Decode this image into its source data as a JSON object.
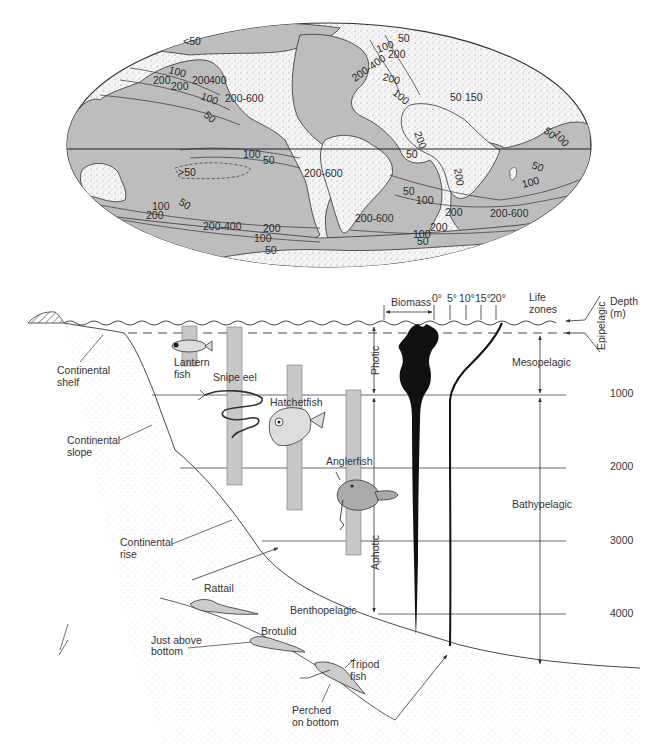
{
  "map": {
    "contour_labels": [
      {
        "text": "<50",
        "x": 183,
        "y": 45
      },
      {
        "text": "100",
        "x": 168,
        "y": 73,
        "rot": 15
      },
      {
        "text": "200",
        "x": 153,
        "y": 84
      },
      {
        "text": "200",
        "x": 171,
        "y": 90
      },
      {
        "text": "200",
        "x": 192,
        "y": 84
      },
      {
        "text": "400",
        "x": 209,
        "y": 84
      },
      {
        "text": "100",
        "x": 200,
        "y": 99,
        "rot": 20
      },
      {
        "text": "200-600",
        "x": 225,
        "y": 102
      },
      {
        "text": "50",
        "x": 203,
        "y": 116,
        "rot": 40
      },
      {
        "text": "50",
        "x": 398,
        "y": 42
      },
      {
        "text": "100",
        "x": 378,
        "y": 53,
        "rot": -20
      },
      {
        "text": "200",
        "x": 388,
        "y": 58
      },
      {
        "text": "200-400",
        "x": 355,
        "y": 82,
        "rot": -35
      },
      {
        "text": "200",
        "x": 382,
        "y": 80,
        "rot": 15
      },
      {
        "text": "100",
        "x": 392,
        "y": 94,
        "rot": 40
      },
      {
        "text": "50",
        "x": 450,
        "y": 101
      },
      {
        "text": "150",
        "x": 465,
        "y": 101
      },
      {
        "text": "200",
        "x": 414,
        "y": 133,
        "rot": 70
      },
      {
        "text": "50",
        "x": 543,
        "y": 132,
        "rot": 40
      },
      {
        "text": "100",
        "x": 553,
        "y": 134,
        "rot": 50
      },
      {
        "text": "50",
        "x": 406,
        "y": 158
      },
      {
        "text": "200",
        "x": 454,
        "y": 169,
        "rot": 80
      },
      {
        "text": ">50",
        "x": 178,
        "y": 176
      },
      {
        "text": "100",
        "x": 243,
        "y": 158
      },
      {
        "text": "50",
        "x": 263,
        "y": 164
      },
      {
        "text": "200-600",
        "x": 304,
        "y": 177
      },
      {
        "text": "50",
        "x": 178,
        "y": 204,
        "rot": 30
      },
      {
        "text": "100",
        "x": 152,
        "y": 210
      },
      {
        "text": "200",
        "x": 146,
        "y": 219
      },
      {
        "text": "50",
        "x": 403,
        "y": 195
      },
      {
        "text": "100",
        "x": 416,
        "y": 204
      },
      {
        "text": "50",
        "x": 531,
        "y": 168,
        "rot": 20
      },
      {
        "text": "100",
        "x": 523,
        "y": 188,
        "rot": -15
      },
      {
        "text": "200-600",
        "x": 355,
        "y": 222
      },
      {
        "text": "200",
        "x": 445,
        "y": 216
      },
      {
        "text": "200-600",
        "x": 490,
        "y": 217
      },
      {
        "text": "200-400",
        "x": 203,
        "y": 230
      },
      {
        "text": "200",
        "x": 263,
        "y": 232
      },
      {
        "text": "100",
        "x": 254,
        "y": 242
      },
      {
        "text": "50",
        "x": 265,
        "y": 254
      },
      {
        "text": "200",
        "x": 430,
        "y": 231
      },
      {
        "text": "100",
        "x": 413,
        "y": 238
      },
      {
        "text": "50",
        "x": 417,
        "y": 245
      }
    ]
  },
  "profile": {
    "header": {
      "biomass": "Biomass",
      "temperatures": [
        "0°",
        "5°",
        "10°",
        "15°",
        "20°"
      ],
      "life_zones_line1": "Life",
      "life_zones_line2": "zones",
      "depth_line1": "Depth",
      "depth_line2": "(m)"
    },
    "depth_ticks": [
      "1000",
      "2000",
      "3000",
      "4000"
    ],
    "light_zones": {
      "photic": "Photic",
      "aphotic": "Aphotic"
    },
    "life_zones": {
      "epipelagic": "Epipelagic",
      "mesopelagic": "Mesopelagic",
      "bathypelagic": "Bathypelagic",
      "benthopelagic": "Benthopelagic"
    },
    "seafloor": {
      "shelf_line1": "Continental",
      "shelf_line2": "shelf",
      "slope_line1": "Continental",
      "slope_line2": "slope",
      "rise_line1": "Continental",
      "rise_line2": "rise"
    },
    "fishes": {
      "lantern_line1": "Lantern",
      "lantern_line2": "fish",
      "snipe_eel": "Snipe eel",
      "hatchetfish": "Hatchetfish",
      "anglerfish": "Anglerfish",
      "rattail": "Rattail",
      "brotulid": "Brotulid",
      "tripod_line1": "Tripod",
      "tripod_line2": "fish"
    },
    "habitat_notes": {
      "above_line1": "Just above",
      "above_line2": "bottom",
      "perched_line1": "Perched",
      "perched_line2": "on bottom"
    }
  },
  "colors": {
    "ocean": "#b9b9b9",
    "land": "#f4f4f4",
    "line": "#333333",
    "bar": "#c8c8c8",
    "biomass": "#111111"
  }
}
